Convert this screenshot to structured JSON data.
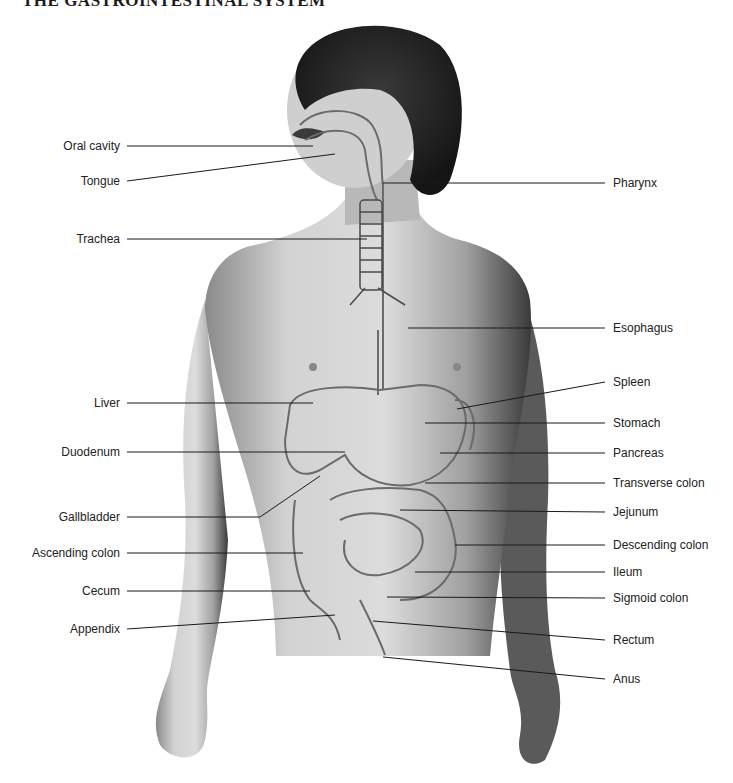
{
  "title": "THE GASTROINTESTINAL SYSTEM",
  "figure": {
    "colors": {
      "line": "#1a1a1a",
      "label_text": "#222222",
      "organ_outline": "#6b6b6b",
      "skin_light": "#d8d8d8",
      "skin_dark": "#7a7a7a",
      "hair": "#2a2a2a"
    }
  },
  "labels_left": [
    {
      "text": "Oral cavity",
      "y": 146
    },
    {
      "text": "Tongue",
      "y": 181
    },
    {
      "text": "Trachea",
      "y": 239
    },
    {
      "text": "Liver",
      "y": 403
    },
    {
      "text": "Duodenum",
      "y": 452
    },
    {
      "text": "Gallbladder",
      "y": 517
    },
    {
      "text": "Ascending colon",
      "y": 553
    },
    {
      "text": "Cecum",
      "y": 591
    },
    {
      "text": "Appendix",
      "y": 629
    }
  ],
  "labels_right": [
    {
      "text": "Pharynx",
      "y": 183
    },
    {
      "text": "Esophagus",
      "y": 328
    },
    {
      "text": "Spleen",
      "y": 382
    },
    {
      "text": "Stomach",
      "y": 423
    },
    {
      "text": "Pancreas",
      "y": 453
    },
    {
      "text": "Transverse colon",
      "y": 483
    },
    {
      "text": "Jejunum",
      "y": 512
    },
    {
      "text": "Descending colon",
      "y": 545
    },
    {
      "text": "Ileum",
      "y": 572
    },
    {
      "text": "Sigmoid colon",
      "y": 598
    },
    {
      "text": "Rectum",
      "y": 640
    },
    {
      "text": "Anus",
      "y": 679
    }
  ]
}
